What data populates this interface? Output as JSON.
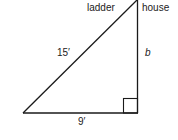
{
  "diagram": {
    "labels": {
      "ladder": "ladder",
      "house": "house",
      "hypotenuse": "15′",
      "base": "9′",
      "height": "b"
    },
    "stroke_color": "#1a1a1a",
    "right_angle_marker": true
  }
}
